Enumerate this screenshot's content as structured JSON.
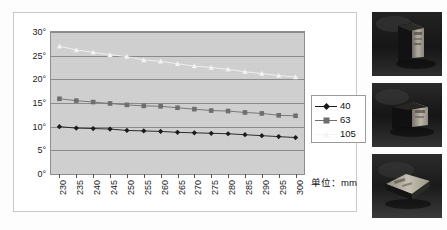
{
  "chart_data": {
    "type": "line",
    "title": "",
    "xlabel": "",
    "ylabel": "",
    "unit_note": "单位：mm",
    "x": [
      230,
      235,
      240,
      245,
      250,
      255,
      260,
      265,
      270,
      275,
      280,
      285,
      290,
      295,
      300
    ],
    "xlim": [
      227.5,
      302.5
    ],
    "ylim": [
      0,
      30
    ],
    "ytick_labels": [
      "0°",
      "5°",
      "10°",
      "15°",
      "20°",
      "25°",
      "30°"
    ],
    "ytick_values": [
      0,
      5,
      10,
      15,
      20,
      25,
      30
    ],
    "grid": true,
    "legend_position": "right",
    "series": [
      {
        "name": "40",
        "marker": "diamond",
        "color": "#1a1a1a",
        "values": [
          10.0,
          9.7,
          9.6,
          9.5,
          9.2,
          9.1,
          9.0,
          8.8,
          8.7,
          8.6,
          8.5,
          8.3,
          8.1,
          7.9,
          7.7
        ]
      },
      {
        "name": "63",
        "marker": "square",
        "color": "#6e6e6e",
        "values": [
          15.9,
          15.5,
          15.2,
          14.9,
          14.6,
          14.4,
          14.3,
          14.0,
          13.7,
          13.4,
          13.3,
          13.0,
          12.8,
          12.4,
          12.3
        ]
      },
      {
        "name": "105",
        "marker": "triangle",
        "color": "#f2f2f2",
        "values": [
          27.0,
          26.2,
          25.7,
          25.2,
          24.8,
          24.1,
          23.8,
          23.3,
          22.8,
          22.5,
          22.1,
          21.6,
          21.2,
          20.8,
          20.5
        ]
      }
    ]
  },
  "legend": {
    "items": [
      {
        "label": "40"
      },
      {
        "label": "63"
      },
      {
        "label": "105"
      }
    ]
  },
  "axes": {
    "x_labels": [
      "230",
      "235",
      "240",
      "245",
      "250",
      "255",
      "260",
      "265",
      "270",
      "275",
      "280",
      "285",
      "290",
      "295",
      "300"
    ],
    "y_labels": [
      "30°",
      "25°",
      "20°",
      "15°",
      "10°",
      "5°",
      "0°"
    ]
  },
  "caption": {
    "unit": "单位：mm"
  },
  "photos": [
    {
      "name": "package-photo-upright"
    },
    {
      "name": "package-photo-tilted"
    },
    {
      "name": "package-photo-flat"
    }
  ],
  "colors": {
    "plot_background": "#cfcfcf",
    "gridline": "#8b8b8b",
    "series_40": "#1a1a1a",
    "series_63": "#6e6e6e",
    "series_105": "#f2f2f2",
    "panel_border": "#c9c9c9"
  }
}
